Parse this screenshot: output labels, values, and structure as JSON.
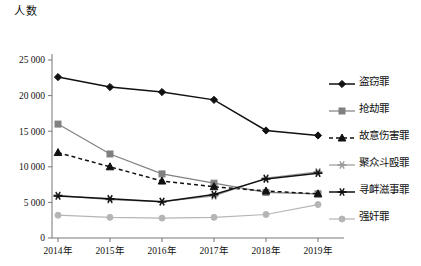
{
  "chart_data": {
    "type": "line",
    "title": "",
    "ylabel": "人数",
    "xlabel": "",
    "categories": [
      "2014年",
      "2015年",
      "2016年",
      "2017年",
      "2018年",
      "2019年"
    ],
    "ylim": [
      0,
      25000
    ],
    "yticks": [
      0,
      5000,
      10000,
      15000,
      20000,
      25000
    ],
    "ytick_labels": [
      "0",
      "5 000",
      "10 000",
      "15 000",
      "20 000",
      "25 000"
    ],
    "grid": false,
    "legend_position": "right",
    "series": [
      {
        "name": "盗窃罪",
        "values": [
          22600,
          21200,
          20500,
          19400,
          15100,
          14400
        ],
        "color": "#111111",
        "marker": "diamond",
        "dash": "solid"
      },
      {
        "name": "抢劫罪",
        "values": [
          16000,
          11800,
          9000,
          7700,
          6400,
          6200
        ],
        "color": "#808080",
        "marker": "square",
        "dash": "solid"
      },
      {
        "name": "故意伤害罪",
        "values": [
          12000,
          10000,
          8000,
          7200,
          6600,
          6200
        ],
        "color": "#111111",
        "marker": "triangle",
        "dash": "dashed"
      },
      {
        "name": "聚众斗殴罪",
        "values": [
          6000,
          5400,
          5100,
          5900,
          8400,
          9300
        ],
        "color": "#9a9a9a",
        "marker": "star",
        "dash": "solid"
      },
      {
        "name": "寻衅滋事罪",
        "values": [
          5900,
          5500,
          5100,
          6100,
          8300,
          9100
        ],
        "color": "#111111",
        "marker": "star",
        "dash": "solid"
      },
      {
        "name": "强奸罪",
        "values": [
          3200,
          2900,
          2800,
          2900,
          3300,
          4700
        ],
        "color": "#b5b5b5",
        "marker": "circle",
        "dash": "solid"
      }
    ]
  },
  "caption": ""
}
